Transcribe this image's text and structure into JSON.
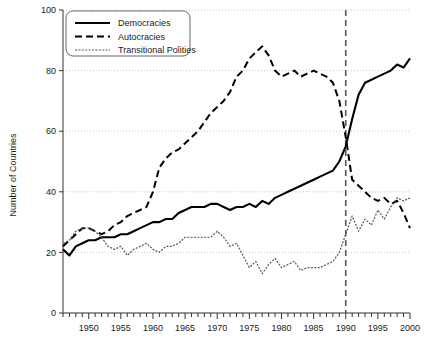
{
  "chart_data": {
    "type": "line",
    "title": "",
    "xlabel": "",
    "ylabel": "Number of Countries",
    "xlim": [
      1946,
      2000
    ],
    "ylim": [
      0,
      100
    ],
    "yticks": [
      0,
      20,
      40,
      60,
      80,
      100
    ],
    "xticks": [
      1950,
      1955,
      1960,
      1965,
      1970,
      1975,
      1980,
      1985,
      1990,
      1995,
      2000
    ],
    "xtick_step_minor": 1,
    "grid": "horizontal-dotted",
    "legend_position": "top-left",
    "annotations": [
      {
        "type": "vline",
        "x": 1990,
        "style": "dashed",
        "color": "#555555"
      }
    ],
    "x": [
      1946,
      1947,
      1948,
      1949,
      1950,
      1951,
      1952,
      1953,
      1954,
      1955,
      1956,
      1957,
      1958,
      1959,
      1960,
      1961,
      1962,
      1963,
      1964,
      1965,
      1966,
      1967,
      1968,
      1969,
      1970,
      1971,
      1972,
      1973,
      1974,
      1975,
      1976,
      1977,
      1978,
      1979,
      1980,
      1981,
      1982,
      1983,
      1984,
      1985,
      1986,
      1987,
      1988,
      1989,
      1990,
      1991,
      1992,
      1993,
      1994,
      1995,
      1996,
      1997,
      1998,
      1999,
      2000
    ],
    "series": [
      {
        "name": "Democracies",
        "style": "solid",
        "color": "#000000",
        "values": [
          21,
          19,
          22,
          23,
          24,
          24,
          25,
          25,
          25,
          26,
          26,
          27,
          28,
          29,
          30,
          30,
          31,
          31,
          33,
          34,
          35,
          35,
          35,
          36,
          36,
          35,
          34,
          35,
          35,
          36,
          35,
          37,
          36,
          38,
          39,
          40,
          41,
          42,
          43,
          44,
          45,
          46,
          47,
          50,
          55,
          64,
          72,
          76,
          77,
          78,
          79,
          80,
          82,
          81,
          84
        ]
      },
      {
        "name": "Autocracies",
        "style": "dashed",
        "color": "#000000",
        "values": [
          22,
          24,
          26,
          28,
          28,
          27,
          26,
          27,
          29,
          30,
          32,
          33,
          34,
          35,
          40,
          48,
          51,
          53,
          54,
          56,
          58,
          60,
          63,
          66,
          68,
          70,
          73,
          78,
          80,
          84,
          86,
          88,
          85,
          80,
          78,
          79,
          80,
          78,
          79,
          80,
          79,
          78,
          76,
          70,
          58,
          44,
          42,
          40,
          38,
          37,
          38,
          36,
          37,
          33,
          28
        ]
      },
      {
        "name": "Transitional Polities",
        "style": "dotted",
        "color": "#555555",
        "values": [
          23,
          24,
          27,
          28,
          28,
          27,
          25,
          22,
          21,
          22,
          19,
          21,
          22,
          23,
          21,
          20,
          22,
          22,
          23,
          25,
          25,
          25,
          25,
          25,
          27,
          25,
          22,
          23,
          19,
          15,
          17,
          13,
          16,
          18,
          15,
          16,
          17,
          14,
          15,
          15,
          15,
          16,
          17,
          20,
          26,
          32,
          27,
          31,
          29,
          34,
          31,
          35,
          38,
          37,
          38
        ]
      }
    ]
  },
  "legend": {
    "items": [
      {
        "label": "Democracies",
        "style": "solid"
      },
      {
        "label": "Autocracies",
        "style": "dashed"
      },
      {
        "label": "Transitional Polities",
        "style": "dotted"
      }
    ]
  },
  "axes": {
    "y_label": "Number of Countries",
    "y_tick_labels": [
      "0",
      "20",
      "40",
      "60",
      "80",
      "100"
    ],
    "x_tick_labels": [
      "1950",
      "1955",
      "1960",
      "1965",
      "1970",
      "1975",
      "1980",
      "1985",
      "1990",
      "1995",
      "2000"
    ]
  },
  "colors": {
    "democracies": "#000000",
    "autocracies": "#000000",
    "transitional": "#555555",
    "vline": "#555555",
    "grid": "#bbbbbb",
    "axis": "#333333",
    "text": "#1a1a1a"
  }
}
